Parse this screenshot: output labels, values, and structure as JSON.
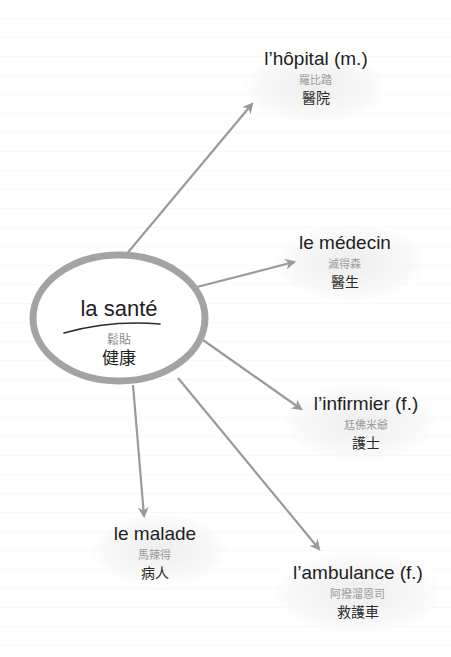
{
  "center": {
    "french": "la santé",
    "phonetic": "鬆貼",
    "chinese": "健康"
  },
  "nodes": [
    {
      "id": "hopital",
      "french": "l’hôpital (m.)",
      "phonetic": "羅比踏",
      "chinese": "醫院"
    },
    {
      "id": "medecin",
      "french": "le médecin",
      "phonetic": "滅得森",
      "chinese": "醫生"
    },
    {
      "id": "infirmier",
      "french": "l’infirmier (f.)",
      "phonetic": "尪佛米爺",
      "chinese": "護士"
    },
    {
      "id": "malade",
      "french": "le malade",
      "phonetic": "馬辣得",
      "chinese": "病人"
    },
    {
      "id": "ambulance",
      "french": "l’ambulance (f.)",
      "phonetic": "阿撥溜恩司",
      "chinese": "救護車"
    }
  ],
  "colors": {
    "ellipse_stroke": "#a3a3a3",
    "arrow": "#9a9a9a",
    "text": "#1e1e1e",
    "phonetic": "#9a9a9a"
  }
}
